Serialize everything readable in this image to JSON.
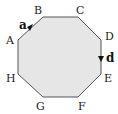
{
  "diagram": {
    "shape": "regular-octagon",
    "fill_color": "#e6e6e6",
    "stroke_color": "#555555",
    "vertices": [
      {
        "label": "A",
        "x": 18,
        "y": 40
      },
      {
        "label": "B",
        "x": 43,
        "y": 17
      },
      {
        "label": "C",
        "x": 78,
        "y": 17
      },
      {
        "label": "D",
        "x": 101,
        "y": 40
      },
      {
        "label": "E",
        "x": 101,
        "y": 74
      },
      {
        "label": "F",
        "x": 78,
        "y": 97
      },
      {
        "label": "G",
        "x": 43,
        "y": 97
      },
      {
        "label": "H",
        "x": 18,
        "y": 74
      }
    ],
    "vectors": [
      {
        "label": "a",
        "from": "A",
        "to": "B"
      },
      {
        "label": "d",
        "from": "D",
        "to": "E"
      }
    ]
  }
}
